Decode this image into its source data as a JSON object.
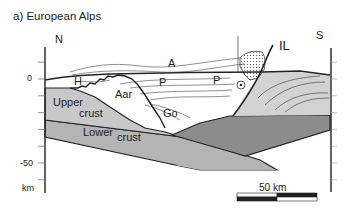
{
  "title": "a) European Alps",
  "orientation": {
    "left": "N",
    "right": "S"
  },
  "depth_axis": {
    "unit": "km",
    "labels": [
      {
        "value": 0,
        "text": "0"
      },
      {
        "value": -50,
        "text": "-50"
      }
    ],
    "tick_interval_km": 10,
    "range_km": [
      10,
      -60
    ]
  },
  "units": {
    "upper_crust": {
      "label_line1": "Upper",
      "label_line2": "crust",
      "color": "#c8c8c8"
    },
    "lower_crust": {
      "label_line1": "Lower",
      "label_line2": "crust",
      "color": "#b4b4b4"
    },
    "adriatic_crust": {
      "color": "#d2d2d2"
    },
    "adriatic_lower": {
      "color": "#8c8c8c"
    },
    "cover_dots": {
      "color": "#ffffff"
    }
  },
  "labels": {
    "helvetic": "H",
    "austroalpine": "A",
    "penninic_1": "P",
    "penninic_2": "P",
    "aar": "Aar",
    "gotthard": "Go",
    "insubric_line": "IL"
  },
  "scale_bar": {
    "label": "50 km",
    "length_km": 50
  }
}
